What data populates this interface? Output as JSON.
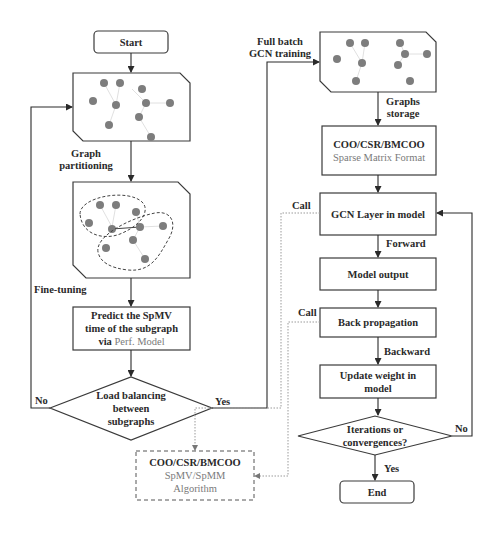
{
  "nodes": {
    "start": "Start",
    "end": "End",
    "predict": {
      "line1": "Predict the SpMV",
      "line2": "time of the subgraph",
      "line3_prefix": "via",
      "line3_highlight": "Perf. Model"
    },
    "load_balance": {
      "line1": "Load balancing",
      "line2": "between",
      "line3": "subgraphs"
    },
    "sparse_format": {
      "title": "COO/CSR/BMCOO",
      "subtitle": "Sparse Matrix Format"
    },
    "gcn_layer": "GCN Layer in model",
    "model_output": "Model output",
    "back_propagation": "Back propagation",
    "update_weight": {
      "line1": "Update weight in",
      "line2": "model"
    },
    "convergence": {
      "line1": "Iterations or",
      "line2": "convergences?"
    },
    "algorithm": {
      "title": "COO/CSR/BMCOO",
      "line2": "SpMV/SpMM",
      "line3": "Algorithm"
    }
  },
  "edge_labels": {
    "graph_partitioning": {
      "line1": "Graph",
      "line2": "partitioning"
    },
    "fine_tuning": "Fine-tuning",
    "no_left": "No",
    "yes_left": "Yes",
    "full_batch": {
      "line1": "Full batch",
      "line2": "GCN training"
    },
    "graphs_storage": {
      "line1": "Graphs",
      "line2": "storage"
    },
    "forward": "Forward",
    "backward": "Backward",
    "call_1": "Call",
    "call_2": "Call",
    "no_right": "No",
    "yes_right": "Yes"
  },
  "colors": {
    "stroke": "#3a3a3a",
    "node_fill": "#7d7d7d",
    "dotted": "#9a9a9a",
    "highlight_text": "#7a7a7a"
  }
}
